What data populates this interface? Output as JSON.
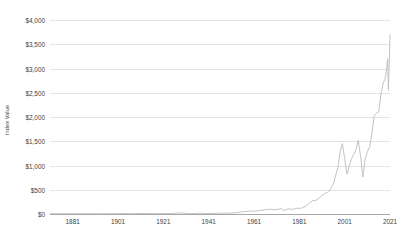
{
  "chart_data": {
    "type": "line",
    "title": "",
    "subtitle": "",
    "xlabel": "",
    "ylabel": "Index Value",
    "grid": true,
    "legend": false,
    "legend_position": "none",
    "xlim": [
      1871,
      2021
    ],
    "ylim": [
      0,
      4000
    ],
    "x_tick_labels": [
      "1881",
      "1901",
      "1921",
      "1941",
      "1961",
      "1981",
      "2001",
      "2021"
    ],
    "x_ticks": [
      1881,
      1901,
      1921,
      1941,
      1961,
      1981,
      2001,
      2021
    ],
    "y_tick_labels": [
      "$0",
      "$500",
      "$1,000",
      "$1,500",
      "$2,000",
      "$2,500",
      "$3,000",
      "$3,500",
      "$4,000"
    ],
    "y_ticks": [
      0,
      500,
      1000,
      1500,
      2000,
      2500,
      3000,
      3500,
      4000
    ],
    "line_color": "#bcbcbc",
    "gridline_color": "#e3e3e3",
    "axis_color": "#a6a6a6",
    "background_color": "#ffffff",
    "series": [
      {
        "name": "Index Value",
        "x": [
          1871,
          1875,
          1879,
          1881,
          1885,
          1889,
          1893,
          1897,
          1901,
          1905,
          1907,
          1909,
          1913,
          1917,
          1919,
          1921,
          1925,
          1929,
          1932,
          1935,
          1937,
          1940,
          1942,
          1945,
          1948,
          1950,
          1953,
          1956,
          1959,
          1962,
          1966,
          1968,
          1970,
          1973,
          1974,
          1976,
          1978,
          1980,
          1982,
          1984,
          1987,
          1988,
          1990,
          1992,
          1994,
          1996,
          1998,
          1999,
          2000,
          2001,
          2002,
          2003,
          2004,
          2005,
          2006,
          2007,
          2008,
          2009,
          2010,
          2011,
          2012,
          2013,
          2014,
          2015,
          2016,
          2017,
          2018,
          2019,
          2020,
          2020.3,
          2020.8,
          2021
        ],
        "values": [
          5,
          5,
          5,
          6,
          6,
          6,
          5,
          6,
          8,
          9,
          7,
          10,
          9,
          8,
          10,
          8,
          13,
          25,
          7,
          11,
          17,
          11,
          8,
          15,
          15,
          18,
          25,
          46,
          58,
          62,
          88,
          99,
          86,
          110,
          72,
          105,
          96,
          118,
          120,
          165,
          285,
          270,
          338,
          415,
          460,
          620,
          960,
          1280,
          1450,
          1150,
          820,
          990,
          1130,
          1230,
          1330,
          1520,
          1200,
          760,
          1130,
          1280,
          1390,
          1650,
          2020,
          2080,
          2100,
          2470,
          2700,
          2800,
          3200,
          2550,
          3340,
          3700
        ]
      }
    ],
    "notable_points": [
      {
        "label": "dot-com peak",
        "x": 2000,
        "y": 1450
      },
      {
        "label": "2002 trough",
        "x": 2002,
        "y": 820
      },
      {
        "label": "2007 peak",
        "x": 2007,
        "y": 1520
      },
      {
        "label": "2009 trough",
        "x": 2009,
        "y": 760
      },
      {
        "label": "2020 drop",
        "x": 2020.3,
        "y": 2550
      },
      {
        "label": "final value",
        "x": 2021,
        "y": 3700
      }
    ]
  }
}
